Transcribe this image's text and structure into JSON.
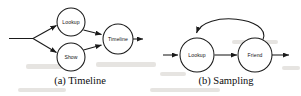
{
  "figure": {
    "background_color": "#ffffff",
    "stroke_color": "#1a1a1a",
    "label_color": "#111111",
    "panels": [
      {
        "id": "panel-a",
        "caption": "(a) Timeline",
        "caption_x": 80,
        "caption_y": 84,
        "entry_arrow": {
          "from_x": 9,
          "from_y": 38,
          "to_x": 33,
          "to_y": 38
        },
        "exit_arrow": {
          "from_x": 133,
          "from_y": 39,
          "to_x": 144,
          "to_y": 39
        },
        "nodes": [
          {
            "name": "Lookup",
            "cx": 71,
            "cy": 22,
            "r": 14
          },
          {
            "name": "Show",
            "cx": 71,
            "cy": 57,
            "r": 14
          },
          {
            "name": "Timeline",
            "cx": 118,
            "cy": 39,
            "r": 15
          }
        ],
        "edges": [
          {
            "from": "input",
            "to": "Lookup",
            "kind": "straight"
          },
          {
            "from": "input",
            "to": "Show",
            "kind": "straight"
          },
          {
            "from": "Lookup",
            "to": "Timeline",
            "kind": "straight"
          },
          {
            "from": "Show",
            "to": "Timeline",
            "kind": "straight"
          },
          {
            "from": "Timeline",
            "to": "output",
            "kind": "straight"
          }
        ]
      },
      {
        "id": "panel-b",
        "caption": "(b) Sampling",
        "caption_x": 226,
        "caption_y": 84,
        "entry_arrow": {
          "from_x": 163,
          "from_y": 55,
          "to_x": 179,
          "to_y": 55
        },
        "exit_arrow": {
          "from_x": 273,
          "from_y": 55,
          "to_x": 290,
          "to_y": 55
        },
        "nodes": [
          {
            "name": "Lookup",
            "cx": 197,
            "cy": 55,
            "r": 17
          },
          {
            "name": "Friend",
            "cx": 255,
            "cy": 55,
            "r": 17
          }
        ],
        "edges": [
          {
            "from": "input",
            "to": "Lookup",
            "kind": "straight"
          },
          {
            "from": "Lookup",
            "to": "Friend",
            "kind": "straight"
          },
          {
            "from": "Friend",
            "to": "Lookup",
            "kind": "curved-feedback"
          },
          {
            "from": "Friend",
            "to": "output",
            "kind": "straight"
          }
        ]
      }
    ]
  }
}
